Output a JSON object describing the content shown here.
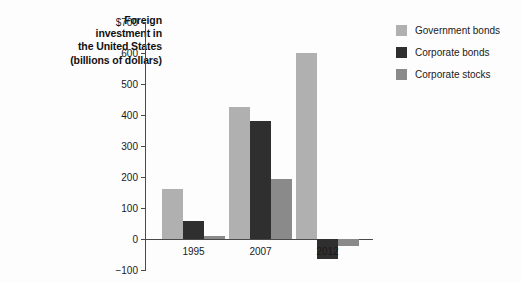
{
  "chart_data": {
    "type": "bar",
    "title": "Foreign investment in the United States (billions of dollars)",
    "title_lines": [
      "Foreign",
      "investment in",
      "the United States",
      "(billions of dollars)"
    ],
    "xlabel": "",
    "ylabel": "billions of dollars",
    "categories": [
      "1995",
      "2007",
      "2012"
    ],
    "ylim": [
      -100,
      700
    ],
    "yticks": [
      -100,
      0,
      100,
      200,
      300,
      400,
      500,
      600,
      700
    ],
    "ytick_labels": [
      "−100",
      "0",
      "100",
      "200",
      "300",
      "400",
      "500",
      "600",
      "$700"
    ],
    "grid": false,
    "legend_position": "right",
    "series": [
      {
        "name": "Government bonds",
        "color": "#b0b0b0",
        "values": [
          160,
          425,
          600
        ]
      },
      {
        "name": "Corporate bonds",
        "color": "#2f2f2f",
        "values": [
          58,
          380,
          -65
        ]
      },
      {
        "name": "Corporate stocks",
        "color": "#8a8a8a",
        "values": [
          10,
          193,
          -22
        ]
      }
    ]
  },
  "legend": {
    "items": [
      {
        "label": "Government bonds",
        "swatch": "government"
      },
      {
        "label": "Corporate bonds",
        "swatch": "corporate-bonds"
      },
      {
        "label": "Corporate stocks",
        "swatch": "corporate-stocks"
      }
    ]
  },
  "colors": {
    "government_bonds": "#b0b0b0",
    "corporate_bonds": "#2f2f2f",
    "corporate_stocks": "#8a8a8a",
    "axis": "#4a4a4a",
    "text": "#1a1a1a",
    "background": "#fdfdfd"
  }
}
